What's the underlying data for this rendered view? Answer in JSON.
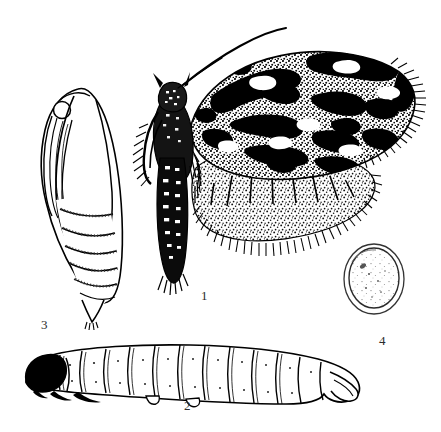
{
  "plate": {
    "title": "Moth life-stages illustration plate",
    "background_color": "#ffffff",
    "ink_color": "#000000",
    "label_color": "#2b2b2b",
    "width": 441,
    "height": 432
  },
  "figures": [
    {
      "number": "1",
      "name": "adult-moth",
      "description": "Adult moth in lateral-dorsal view with one mottled black-and-white forewing spread to the right, a stippled grey hindwing below it, a long curved antenna sweeping up and to the right, dark banded abdomen and fringed legs.",
      "label_x": 201,
      "label_y": 289
    },
    {
      "number": "2",
      "name": "larva",
      "description": "Elongate caterpillar in lateral view facing left, with a solid black head capsule, three small dark thoracic legs, about twelve pale body segments outlined in black, and a down-curved anal segment at the right.",
      "label_x": 184,
      "label_y": 399
    },
    {
      "number": "3",
      "name": "pupa",
      "description": "Pupa in ventro-lateral view, elongate oval with eye and wing cases at the upper left, segmented abdomen with rows of fine dots, tapering to a pointed cremaster bearing hooked spines.",
      "label_x": 41,
      "label_y": 318
    },
    {
      "number": "4",
      "name": "egg",
      "description": "Single flattened oval egg drawn with a double outline and faint speckling across the inner surface.",
      "label_x": 379,
      "label_y": 334
    }
  ],
  "labels": {
    "fig1": "1",
    "fig2": "2",
    "fig3": "3",
    "fig4": "4"
  }
}
